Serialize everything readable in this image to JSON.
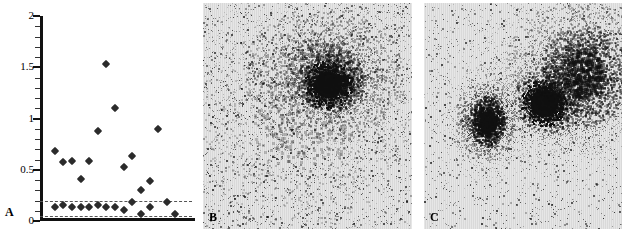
{
  "figure": {
    "panels": [
      {
        "id": "A",
        "tag": "A",
        "type": "scatter"
      },
      {
        "id": "B",
        "tag": "B",
        "type": "scintigram"
      },
      {
        "id": "C",
        "tag": "C",
        "type": "scintigram"
      }
    ]
  },
  "chart_data": {
    "type": "scatter",
    "title": "",
    "xlabel": "",
    "ylabel": "",
    "ylim": [
      0,
      2
    ],
    "xlim": [
      0,
      16
    ],
    "grid": false,
    "legend": false,
    "y_ticks_major": [
      0,
      0.5,
      1,
      1.5,
      2
    ],
    "y_ticklabels": [
      "0",
      "0.5",
      "1",
      "1.5",
      "2"
    ],
    "y_ticks_minor": [
      0.1,
      0.2,
      0.3,
      0.4,
      0.6,
      0.7,
      0.8,
      0.9,
      1.1,
      1.2,
      1.3,
      1.4,
      1.6,
      1.7,
      1.8,
      1.9
    ],
    "series": [
      {
        "name": "upper-values",
        "x": [
          1,
          2,
          3,
          4,
          5,
          6,
          7,
          8,
          9,
          10,
          11,
          12,
          13,
          14,
          15
        ],
        "values": [
          0.68,
          0.58,
          0.59,
          0.41,
          0.59,
          0.88,
          1.53,
          1.1,
          0.53,
          0.63,
          0.3,
          0.39,
          0.9,
          0.19,
          0.07
        ]
      },
      {
        "name": "lower-values",
        "x": [
          1,
          2,
          3,
          4,
          5,
          6,
          7,
          8,
          9,
          10,
          11,
          12
        ],
        "values": [
          0.14,
          0.16,
          0.14,
          0.14,
          0.14,
          0.16,
          0.14,
          0.14,
          0.11,
          0.19,
          0.07,
          0.14
        ]
      }
    ],
    "reference_lines": [
      {
        "name": "upper-threshold",
        "y": 0.2,
        "style": "dashed"
      },
      {
        "name": "lower-threshold",
        "y": 0.05,
        "style": "dashed"
      }
    ]
  },
  "colors": {
    "axis": "#111111",
    "marker": "#2b2b2b",
    "threshold": "#555555",
    "scintigram_background": "#d9d9d9",
    "scintigram_signal": "#101010"
  },
  "panelA": {
    "tag": "A",
    "tick_labels": [
      "2",
      "1.5",
      "1",
      "0.5",
      "0"
    ]
  },
  "panelB": {
    "tag": "B",
    "description": "scintigram with single dense focus"
  },
  "panelC": {
    "tag": "C",
    "description": "scintigram with three foci"
  }
}
